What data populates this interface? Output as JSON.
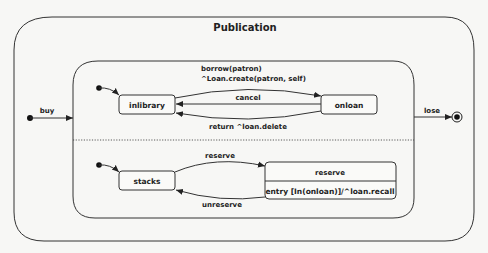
{
  "diagram": {
    "title": "Publication",
    "outer_transitions": {
      "buy": "buy",
      "lose": "lose"
    },
    "regions": [
      {
        "states": [
          "inlibrary",
          "onloan"
        ],
        "transitions": {
          "borrow_line1": "borrow(patron)",
          "borrow_line2": "^Loan.create(patron, self)",
          "cancel": "cancel",
          "return": "return ^loan.delete"
        }
      },
      {
        "states": [
          "stacks",
          "reserve"
        ],
        "reserve_entry": "entry [In(onloan)]/^loan.recall",
        "transitions": {
          "reserve": "reserve",
          "unreserve": "unreserve"
        }
      }
    ]
  },
  "colors": {
    "stroke": "#333333",
    "background": "#f7f7f5",
    "text": "#222222"
  }
}
